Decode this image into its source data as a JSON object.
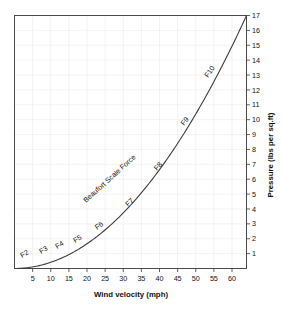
{
  "chart_data": {
    "type": "line",
    "title": "",
    "xlabel": "Wind velocity (mph)",
    "ylabel": "Pressure (lbs per sq.ft)",
    "xlim": [
      0,
      64
    ],
    "ylim": [
      0,
      17
    ],
    "grid": true,
    "legend_position": "none",
    "xticks": [
      5,
      10,
      15,
      20,
      25,
      30,
      35,
      40,
      45,
      50,
      55,
      60
    ],
    "xticklabels": [
      "5",
      "10",
      "15",
      "20",
      "25",
      "30",
      "35",
      "40",
      "45",
      "50",
      "55",
      "60"
    ],
    "yticks": [
      1,
      2,
      3,
      4,
      5,
      6,
      7,
      8,
      9,
      10,
      11,
      12,
      13,
      14,
      15,
      16,
      17
    ],
    "yticklabels": [
      "1",
      "2",
      "3",
      "4",
      "5",
      "6",
      "7",
      "8",
      "9",
      "10",
      "11",
      "12",
      "13",
      "14",
      "15",
      "16",
      "17"
    ],
    "y_axis_side": "right",
    "series": [
      {
        "name": "Wind pressure",
        "relation": "P = 0.00415 * v^2",
        "x": [
          0,
          5,
          10,
          15,
          20,
          25,
          30,
          35,
          40,
          45,
          50,
          55,
          60,
          64
        ],
        "values": [
          0.0,
          0.1,
          0.42,
          0.93,
          1.66,
          2.59,
          3.74,
          5.08,
          6.64,
          8.4,
          10.38,
          12.55,
          14.94,
          17.0
        ]
      }
    ],
    "annotations": [
      {
        "label": "F2",
        "x": 5,
        "y": 0.5
      },
      {
        "label": "F3",
        "x": 10,
        "y": 0.95
      },
      {
        "label": "F4",
        "x": 14,
        "y": 1.55
      },
      {
        "label": "F5",
        "x": 19,
        "y": 2.2
      },
      {
        "label": "F6",
        "x": 25,
        "y": 3.1
      },
      {
        "label": "F7",
        "x": 32,
        "y": 4.5
      },
      {
        "label": "F8",
        "x": 39,
        "y": 6.9
      },
      {
        "label": "F9",
        "x": 47,
        "y": 10.5
      },
      {
        "label": "F10",
        "x": 55,
        "y": 14.2
      },
      {
        "label": "Beaufort Scale Force",
        "x": 30,
        "y": 6.6,
        "rotation": -42
      }
    ]
  },
  "labels": {
    "xlabel": "Wind velocity (mph)",
    "ylabel": "Pressure (lbs per sq.ft)",
    "f2": "F2",
    "f3": "F3",
    "f4": "F4",
    "f5": "F5",
    "f6": "F6",
    "f7": "F7",
    "f8": "F8",
    "f9": "F9",
    "f10": "F10",
    "beaufort": "Beaufort Scale Force",
    "x1": "5",
    "x2": "10",
    "x3": "15",
    "x4": "20",
    "x5": "25",
    "x6": "30",
    "x7": "35",
    "x8": "40",
    "x9": "45",
    "x10": "50",
    "x11": "55",
    "x12": "60",
    "y1": "1",
    "y2": "2",
    "y3": "3",
    "y4": "4",
    "y5": "5",
    "y6": "6",
    "y7": "7",
    "y8": "8",
    "y9": "9",
    "y10": "10",
    "y11": "11",
    "y12": "12",
    "y13": "13",
    "y14": "14",
    "y15": "15",
    "y16": "16",
    "y17": "17"
  },
  "colors": {
    "curve": "#3d3d3d",
    "frame": "#4a4a4a",
    "grid": "#e6e6e6",
    "text": "#111111",
    "background": "#ffffff"
  }
}
